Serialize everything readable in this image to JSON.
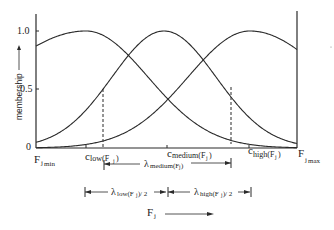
{
  "diagram": {
    "y_axis": {
      "label": "membership",
      "ticks": [
        {
          "label": "1.0",
          "value": 1.0
        },
        {
          "label": "0.5",
          "value": 0.5
        },
        {
          "label": "0",
          "value": 0
        }
      ]
    },
    "x_axis": {
      "variable": "F",
      "variable_sub": "j",
      "min_label": {
        "main": "F",
        "sub": "j",
        "subsub": "min"
      },
      "max_label": {
        "main": "F",
        "sub": "j",
        "subsub": "max"
      },
      "centers": [
        {
          "main": "c",
          "sub": "low(F",
          "subj": "j",
          "close": ")"
        },
        {
          "main": "c",
          "sub": "medium(F",
          "subj": "j",
          "close": ")"
        },
        {
          "main": "c",
          "sub": "high(F",
          "subj": "j",
          "close": ")"
        }
      ]
    },
    "curves": [
      {
        "name": "low",
        "center_px": 86,
        "sigma_left": 95,
        "sigma_right": 62,
        "peak": 1.0
      },
      {
        "name": "medium",
        "center_px": 164,
        "sigma_left": 52,
        "sigma_right": 52,
        "peak": 1.0
      },
      {
        "name": "high",
        "center_px": 250,
        "sigma_left": 62,
        "sigma_right": 80,
        "peak": 1.0
      }
    ],
    "dashed_markers": [
      {
        "x_px": 103,
        "value": 0.5,
        "ref": "low crossover"
      },
      {
        "x_px": 231,
        "value": 0.5,
        "ref": "high crossover"
      }
    ],
    "spans": [
      {
        "symbol": "λ",
        "sub": "medium(F",
        "subj": "j",
        "close": ")",
        "suffix": "",
        "x1": 104,
        "x2": 231,
        "y": 164
      },
      {
        "symbol": "λ",
        "sub": "low(F",
        "subj": "j",
        "close": ")",
        "suffix": " / 2",
        "x1": 85,
        "x2": 168,
        "y": 192
      },
      {
        "symbol": "λ",
        "sub": "high(F",
        "subj": "j",
        "close": ")",
        "suffix": " / 2",
        "x1": 168,
        "x2": 251,
        "y": 192
      }
    ],
    "direction_label": {
      "main": "F",
      "sub": "j"
    },
    "colors": {
      "line": "#2a2a2a",
      "background": "#ffffff"
    }
  }
}
